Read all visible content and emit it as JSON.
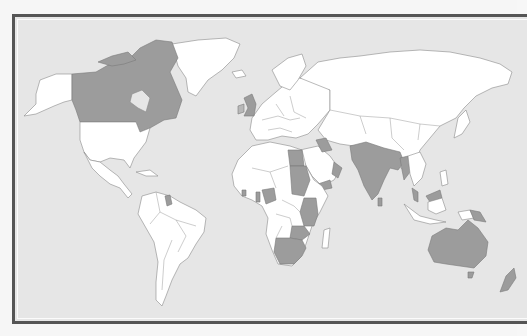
{
  "figure": {
    "type": "world-map",
    "colors": {
      "ocean": "#e6e6e6",
      "land": "#ffffff",
      "highlighted": "#9c9c9c",
      "country_border": "#8a8a8a",
      "frame": "#555555"
    },
    "watermark": ""
  },
  "legend": {
    "highlighted_countries": [
      "Canada",
      "United Kingdom",
      "Egypt",
      "Sudan",
      "Jordan",
      "Iraq",
      "Oman",
      "Yemen",
      "India",
      "Pakistan",
      "Bangladesh",
      "Myanmar",
      "Sri Lanka",
      "Malaysia",
      "Papua New Guinea",
      "Australia",
      "New Zealand",
      "Kenya",
      "Uganda",
      "Tanzania",
      "Zambia",
      "Malawi",
      "Zimbabwe",
      "Botswana",
      "Namibia",
      "South Africa",
      "Nigeria",
      "Ghana",
      "Sierra Leone",
      "Gambia",
      "Guyana"
    ]
  }
}
